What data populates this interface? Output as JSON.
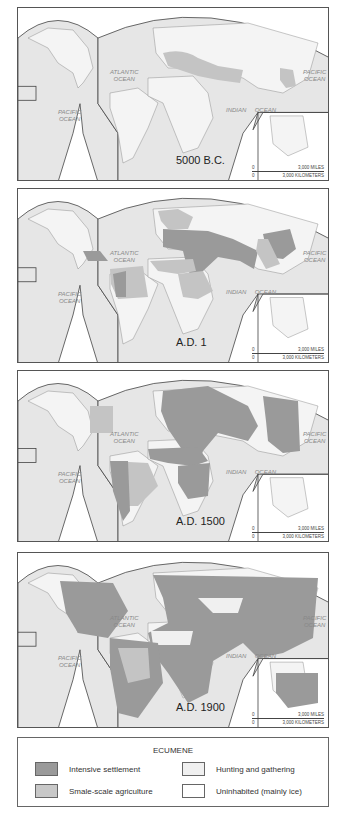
{
  "maps": [
    {
      "era": "5000 B.C.",
      "top": 7,
      "height": 174
    },
    {
      "era": "A.D. 1",
      "top": 188,
      "height": 175
    },
    {
      "era": "A.D. 1500",
      "top": 370,
      "height": 172
    },
    {
      "era": "A.D. 1900",
      "top": 552,
      "height": 176
    }
  ],
  "ocean_labels": {
    "atlantic": "ATLANTIC OCEAN",
    "pacific_west": "PACIFIC OCEAN",
    "pacific_east": "PACIFIC OCEAN",
    "indian_1": "INDIAN",
    "indian_2": "OCEAN"
  },
  "scale": {
    "zero": "0",
    "miles": "3,000 MILES",
    "km": "3,000 KILOMETERS"
  },
  "legend": {
    "title": "ECUMENE",
    "items": [
      {
        "label": "Intensive settlement",
        "color": "#9a9a9a"
      },
      {
        "label": "Smale-scale agriculture",
        "color": "#c4c4c4"
      },
      {
        "label": "Hunting and gathering",
        "color": "#f0f0f0"
      },
      {
        "label": "Uninhabited (mainly ice)",
        "color": "#ffffff"
      }
    ]
  },
  "colors": {
    "ocean": "#e4e4e4",
    "land": "#f4f4f4",
    "intensive": "#9a9a9a",
    "small": "#c4c4c4",
    "border": "#444444"
  }
}
